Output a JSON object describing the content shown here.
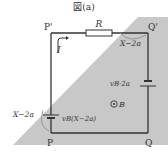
{
  "figure": {
    "title": "図(a)",
    "corners": {
      "top_left": "P'",
      "top_right": "Q'",
      "bottom_left": "P",
      "bottom_right": "Q"
    },
    "resistor_label": "R",
    "current_label": "I",
    "field_label": "B",
    "angle_label_top": "X−2a",
    "angle_label_left": "X−2a",
    "emf_right": "vB·2a",
    "emf_left": "vB(X−2a)",
    "colors": {
      "region": "#c8c8c8",
      "line": "#333333",
      "background": "#ffffff"
    }
  }
}
